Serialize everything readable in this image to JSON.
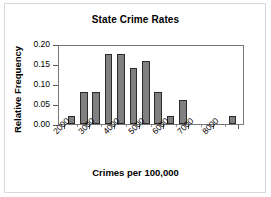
{
  "chart_data": {
    "type": "bar",
    "title": "State Crime Rates",
    "xlabel": "Crimes per 100,000",
    "ylabel": "Relative Frequency",
    "grid": false,
    "legend": null,
    "xlim": [
      1750,
      9250
    ],
    "ylim": [
      0.0,
      0.2
    ],
    "bin_width": 500,
    "yticks": [
      "0.00",
      "0.05",
      "0.10",
      "0.15",
      "0.20"
    ],
    "ytick_values": [
      0.0,
      0.05,
      0.1,
      0.15,
      0.2
    ],
    "xticks": [
      "2000",
      "3000",
      "4000",
      "5000",
      "6000",
      "7000",
      "8000"
    ],
    "xtick_values": [
      2000,
      3000,
      4000,
      5000,
      6000,
      7000,
      8000
    ],
    "bin_starts": [
      2000,
      2500,
      3000,
      3500,
      4000,
      4500,
      5000,
      5500,
      6000,
      6500,
      7000,
      7500,
      8000,
      8500
    ],
    "bin_labels": [
      "2000-2500",
      "2500-3000",
      "3000-3500",
      "3500-4000",
      "4000-4500",
      "4500-5000",
      "5000-5500",
      "5500-6000",
      "6000-6500",
      "6500-7000",
      "7000-7500",
      "7500-8000",
      "8000-8500",
      "8500-9000"
    ],
    "values": [
      0.02,
      0.08,
      0.08,
      0.175,
      0.175,
      0.14,
      0.157,
      0.08,
      0.02,
      0.06,
      0.0,
      0.0,
      0.0,
      0.02
    ],
    "bar_color": "#808080",
    "bar_edge_color": "#2b2b2b"
  },
  "chart": {
    "title": "State Crime Rates",
    "xlabel": "Crimes per 100,000",
    "ylabel": "Relative Frequency"
  }
}
